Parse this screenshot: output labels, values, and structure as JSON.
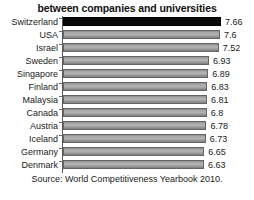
{
  "chart_data": {
    "type": "bar",
    "orientation": "horizontal",
    "title": "between companies and universities",
    "xlabel": "",
    "ylabel": "",
    "categories": [
      "Switzerland",
      "USA",
      "Israel",
      "Sweden",
      "Singapore",
      "Finland",
      "Malaysia",
      "Canada",
      "Austria",
      "Iceland",
      "Germany",
      "Denmark"
    ],
    "values": [
      7.66,
      7.6,
      7.52,
      6.93,
      6.89,
      6.83,
      6.81,
      6.8,
      6.78,
      6.73,
      6.65,
      6.63
    ],
    "value_labels": [
      "7.66",
      "7.6",
      "7.52",
      "6.93",
      "6.89",
      "6.83",
      "6.81",
      "6.8",
      "6.78",
      "6.73",
      "6.65",
      "6.63"
    ],
    "highlight_index": 0,
    "highlight_color": "#0a0a0a",
    "bar_color": "#b4b4b4",
    "bar_border_color": "#646464",
    "axis_color": "#5a5a5a",
    "grid": false,
    "legend": null,
    "xlim": [
      6.2,
      7.78
    ],
    "source": "Source: World Competitiveness Yearbook 2010."
  },
  "rows": [
    {
      "label": "Switzerland",
      "value": "7.66",
      "pct": 100.0,
      "highlight": true
    },
    {
      "label": "USA",
      "value": "7.6",
      "pct": 94.2,
      "highlight": false
    },
    {
      "label": "Israel",
      "value": "7.52",
      "pct": 86.4,
      "highlight": false
    },
    {
      "label": "Sweden",
      "value": "6.93",
      "pct": 29.1,
      "highlight": false
    },
    {
      "label": "Singapore",
      "value": "6.89",
      "pct": 25.2,
      "highlight": false
    },
    {
      "label": "Finland",
      "value": "6.83",
      "pct": 19.4,
      "highlight": false
    },
    {
      "label": "Malaysia",
      "value": "6.81",
      "pct": 17.5,
      "highlight": false
    },
    {
      "label": "Canada",
      "value": "6.8",
      "pct": 16.5,
      "highlight": false
    },
    {
      "label": "Austria",
      "value": "6.78",
      "pct": 14.6,
      "highlight": false
    },
    {
      "label": "Iceland",
      "value": "6.73",
      "pct": 9.7,
      "highlight": false
    },
    {
      "label": "Germany",
      "value": "6.65",
      "pct": 1.9,
      "highlight": false
    },
    {
      "label": "Denmark",
      "value": "6.63",
      "pct": 0.0,
      "highlight": false
    }
  ],
  "footer": {
    "faint_text": ""
  }
}
